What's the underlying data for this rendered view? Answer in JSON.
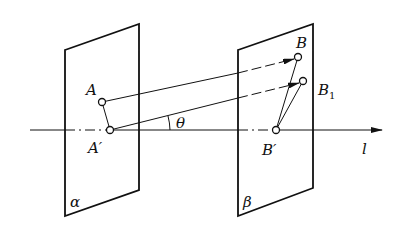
{
  "labels": {
    "A": "A",
    "A_prime": "A′",
    "B": "B",
    "B1": "B",
    "B1_sub": "1",
    "B_prime": "B′",
    "theta": "θ",
    "l": "l",
    "alpha": "α",
    "beta": "β"
  },
  "colors": {
    "stroke": "#111111",
    "background": "#ffffff"
  }
}
